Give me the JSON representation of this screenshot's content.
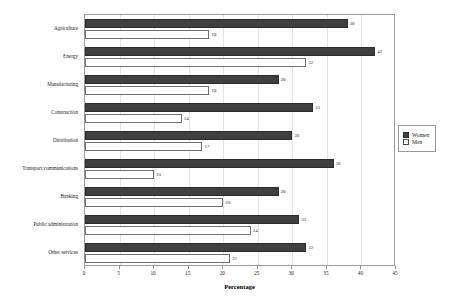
{
  "chart_data": {
    "type": "bar",
    "orientation": "horizontal",
    "title": "",
    "xlabel": "Percentage",
    "ylabel": "",
    "xlim": [
      0,
      45
    ],
    "xticks": [
      0,
      5,
      10,
      15,
      20,
      25,
      30,
      35,
      40,
      45
    ],
    "grid": true,
    "legend_position": "right",
    "categories": [
      "Agriculture",
      "Energy",
      "Manufacturing",
      "Construction",
      "Distribution",
      "Transport/communications",
      "Banking",
      "Public administration",
      "Other services"
    ],
    "series": [
      {
        "name": "Women",
        "color": "#3f3f3f",
        "values": [
          38,
          42,
          28,
          33,
          30,
          36,
          28,
          31,
          32
        ]
      },
      {
        "name": "Men",
        "color": "#ffffff",
        "values": [
          18,
          32,
          18,
          14,
          17,
          10,
          20,
          24,
          21
        ]
      }
    ]
  },
  "legend": {
    "items": [
      {
        "label": "Women"
      },
      {
        "label": "Men"
      }
    ]
  }
}
